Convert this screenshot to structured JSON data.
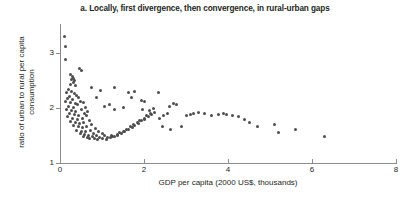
{
  "chart_data": {
    "type": "scatter",
    "title": "a. Locally, first divergence, then convergence, in rural-urban gaps",
    "xlabel": "GDP per capita (2000 US$, thousands)",
    "ylabel": "ratio of urban to rural per capita consumption",
    "xlim": [
      0,
      8
    ],
    "ylim": [
      1,
      3.5
    ],
    "xticks": [
      0,
      2,
      4,
      6,
      8
    ],
    "xtick_labels": [
      "0",
      "2",
      "4",
      "6",
      "8"
    ],
    "yticks": [
      1,
      2,
      3
    ],
    "ytick_labels": [
      "1",
      "2",
      "3"
    ],
    "grid": false,
    "legend": "none",
    "marker": "diamond",
    "marker_color": "#4d4d4d",
    "axis_color": "#8c8c8c",
    "points": [
      [
        0.1,
        3.3
      ],
      [
        0.14,
        3.12
      ],
      [
        0.12,
        2.88
      ],
      [
        0.26,
        2.62
      ],
      [
        0.3,
        2.58
      ],
      [
        0.28,
        2.52
      ],
      [
        0.33,
        2.55
      ],
      [
        0.31,
        2.47
      ],
      [
        0.35,
        2.5
      ],
      [
        0.24,
        2.44
      ],
      [
        0.38,
        2.42
      ],
      [
        0.2,
        2.34
      ],
      [
        0.27,
        2.3
      ],
      [
        0.16,
        2.28
      ],
      [
        0.34,
        2.26
      ],
      [
        0.22,
        2.22
      ],
      [
        0.4,
        2.24
      ],
      [
        0.18,
        2.18
      ],
      [
        0.3,
        2.16
      ],
      [
        0.44,
        2.2
      ],
      [
        0.12,
        2.12
      ],
      [
        0.26,
        2.1
      ],
      [
        0.36,
        2.08
      ],
      [
        0.48,
        2.12
      ],
      [
        0.2,
        2.04
      ],
      [
        0.32,
        2.02
      ],
      [
        0.42,
        2.06
      ],
      [
        0.55,
        2.1
      ],
      [
        0.15,
        1.98
      ],
      [
        0.28,
        1.96
      ],
      [
        0.38,
        1.94
      ],
      [
        0.5,
        1.98
      ],
      [
        0.6,
        2.02
      ],
      [
        0.22,
        1.9
      ],
      [
        0.34,
        1.88
      ],
      [
        0.45,
        1.86
      ],
      [
        0.58,
        1.9
      ],
      [
        0.66,
        1.94
      ],
      [
        0.18,
        1.84
      ],
      [
        0.3,
        1.82
      ],
      [
        0.41,
        1.8
      ],
      [
        0.53,
        1.82
      ],
      [
        0.63,
        1.86
      ],
      [
        0.25,
        1.76
      ],
      [
        0.36,
        1.74
      ],
      [
        0.47,
        1.72
      ],
      [
        0.57,
        1.74
      ],
      [
        0.7,
        1.78
      ],
      [
        0.32,
        1.68
      ],
      [
        0.43,
        1.66
      ],
      [
        0.54,
        1.64
      ],
      [
        0.64,
        1.66
      ],
      [
        0.76,
        1.7
      ],
      [
        0.4,
        1.6
      ],
      [
        0.5,
        1.58
      ],
      [
        0.6,
        1.57
      ],
      [
        0.72,
        1.6
      ],
      [
        0.84,
        1.63
      ],
      [
        0.48,
        1.54
      ],
      [
        0.58,
        1.52
      ],
      [
        0.68,
        1.51
      ],
      [
        0.8,
        1.54
      ],
      [
        0.92,
        1.57
      ],
      [
        0.56,
        1.48
      ],
      [
        0.66,
        1.47
      ],
      [
        0.78,
        1.48
      ],
      [
        0.88,
        1.5
      ],
      [
        1.0,
        1.53
      ],
      [
        0.7,
        1.44
      ],
      [
        0.82,
        1.45
      ],
      [
        0.94,
        1.47
      ],
      [
        1.06,
        1.5
      ],
      [
        0.9,
        1.42
      ],
      [
        1.02,
        1.44
      ],
      [
        1.14,
        1.47
      ],
      [
        1.22,
        1.5
      ],
      [
        1.1,
        1.43
      ],
      [
        1.2,
        1.46
      ],
      [
        1.3,
        1.49
      ],
      [
        1.38,
        1.52
      ],
      [
        1.26,
        1.48
      ],
      [
        1.36,
        1.51
      ],
      [
        1.46,
        1.54
      ],
      [
        1.54,
        1.57
      ],
      [
        1.42,
        1.55
      ],
      [
        1.52,
        1.58
      ],
      [
        1.62,
        1.61
      ],
      [
        1.72,
        1.64
      ],
      [
        1.58,
        1.62
      ],
      [
        1.68,
        1.66
      ],
      [
        1.78,
        1.69
      ],
      [
        1.88,
        1.72
      ],
      [
        1.74,
        1.7
      ],
      [
        1.84,
        1.74
      ],
      [
        1.94,
        1.77
      ],
      [
        2.02,
        1.8
      ],
      [
        1.9,
        1.78
      ],
      [
        2.0,
        1.82
      ],
      [
        2.1,
        1.85
      ],
      [
        2.18,
        1.88
      ],
      [
        2.06,
        1.86
      ],
      [
        2.16,
        1.9
      ],
      [
        2.26,
        1.93
      ],
      [
        0.86,
        2.2
      ],
      [
        1.05,
        2.04
      ],
      [
        1.3,
        1.98
      ],
      [
        1.52,
        2.02
      ],
      [
        1.7,
        2.2
      ],
      [
        1.78,
        2.3
      ],
      [
        1.95,
        2.14
      ],
      [
        2.02,
        2.12
      ],
      [
        1.96,
        1.98
      ],
      [
        2.12,
        1.96
      ],
      [
        2.22,
        2.0
      ],
      [
        2.36,
        1.82
      ],
      [
        2.46,
        1.86
      ],
      [
        2.56,
        1.9
      ],
      [
        2.6,
        2.04
      ],
      [
        2.7,
        2.08
      ],
      [
        2.78,
        2.06
      ],
      [
        2.44,
        1.66
      ],
      [
        2.62,
        1.62
      ],
      [
        2.9,
        1.66
      ],
      [
        3.0,
        1.86
      ],
      [
        3.1,
        1.88
      ],
      [
        3.18,
        1.9
      ],
      [
        3.3,
        1.92
      ],
      [
        3.44,
        1.9
      ],
      [
        3.6,
        1.86
      ],
      [
        3.78,
        1.88
      ],
      [
        3.9,
        1.9
      ],
      [
        3.96,
        1.89
      ],
      [
        4.1,
        1.86
      ],
      [
        4.24,
        1.84
      ],
      [
        4.4,
        1.8
      ],
      [
        4.52,
        1.74
      ],
      [
        4.7,
        1.66
      ],
      [
        5.1,
        1.7
      ],
      [
        5.2,
        1.56
      ],
      [
        5.6,
        1.62
      ],
      [
        6.3,
        1.48
      ],
      [
        2.34,
        2.28
      ],
      [
        1.62,
        2.28
      ],
      [
        1.3,
        2.38
      ],
      [
        1.18,
        2.06
      ],
      [
        0.96,
        2.32
      ],
      [
        0.74,
        2.38
      ],
      [
        0.52,
        2.68
      ],
      [
        0.46,
        2.72
      ]
    ]
  }
}
